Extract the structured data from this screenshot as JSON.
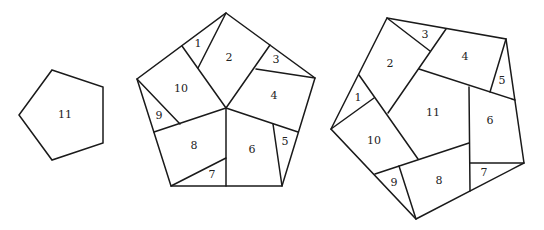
{
  "figures": [
    {
      "name": "whole-pentagon",
      "pieces": [
        {
          "label": "11",
          "x": 65,
          "y": 115
        }
      ]
    },
    {
      "name": "regular-pentagon-dissection",
      "pieces": [
        {
          "label": "1",
          "x": 198,
          "y": 44
        },
        {
          "label": "2",
          "x": 229,
          "y": 58
        },
        {
          "label": "3",
          "x": 276,
          "y": 60
        },
        {
          "label": "4",
          "x": 274,
          "y": 96
        },
        {
          "label": "5",
          "x": 285,
          "y": 142
        },
        {
          "label": "6",
          "x": 252,
          "y": 150
        },
        {
          "label": "7",
          "x": 212,
          "y": 175
        },
        {
          "label": "8",
          "x": 194,
          "y": 146
        },
        {
          "label": "9",
          "x": 159,
          "y": 116
        },
        {
          "label": "10",
          "x": 181,
          "y": 89
        }
      ]
    },
    {
      "name": "irregular-pentagon-dissection",
      "pieces": [
        {
          "label": "1",
          "x": 358,
          "y": 98
        },
        {
          "label": "2",
          "x": 390,
          "y": 64
        },
        {
          "label": "3",
          "x": 425,
          "y": 35
        },
        {
          "label": "4",
          "x": 465,
          "y": 57
        },
        {
          "label": "5",
          "x": 502,
          "y": 81
        },
        {
          "label": "6",
          "x": 490,
          "y": 121
        },
        {
          "label": "7",
          "x": 484,
          "y": 173
        },
        {
          "label": "8",
          "x": 439,
          "y": 181
        },
        {
          "label": "9",
          "x": 394,
          "y": 183
        },
        {
          "label": "10",
          "x": 374,
          "y": 141
        },
        {
          "label": "11",
          "x": 433,
          "y": 113
        }
      ]
    }
  ]
}
